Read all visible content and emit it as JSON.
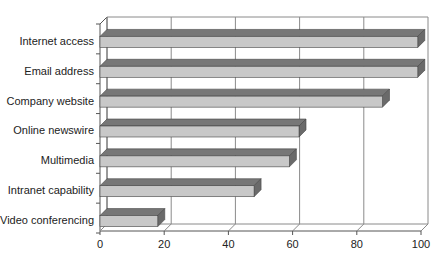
{
  "chart_data": {
    "type": "bar",
    "orientation": "horizontal",
    "style": "3d",
    "title": "",
    "xlabel": "",
    "ylabel": "",
    "categories": [
      "Internet access",
      "Email address",
      "Company website",
      "Online newswire",
      "Multimedia",
      "Intranet capability",
      "Video conferencing"
    ],
    "values": [
      99,
      99,
      88,
      62,
      59,
      48,
      18
    ],
    "xlim": [
      0,
      100
    ],
    "xticks": [
      "0",
      "20",
      "40",
      "60",
      "80",
      "100"
    ],
    "grid": true,
    "legend": null,
    "colors": {
      "bar_front": "#c8c8c8",
      "bar_top": "#777777",
      "bar_side": "#6a6a6a",
      "grid": "#8a8a8a",
      "axis": "#555555"
    }
  }
}
